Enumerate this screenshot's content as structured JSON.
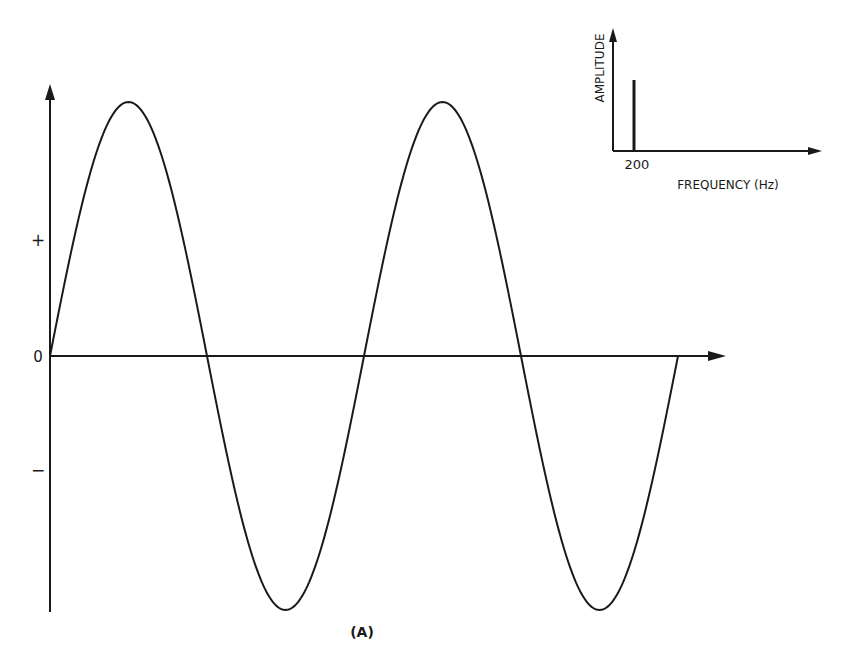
{
  "figure": {
    "caption": "(A)",
    "main_plot": {
      "y_labels": {
        "plus": "+",
        "zero": "0",
        "minus": "−"
      },
      "waveform": "sine",
      "cycles": 2,
      "line_color": "#1a1a1a"
    },
    "inset": {
      "ylabel": "AMPLITUDE",
      "xlabel": "FREQUENCY (Hz)",
      "tick_label": "200"
    }
  },
  "chart_data": [
    {
      "type": "line",
      "title": "",
      "xlabel": "",
      "ylabel": "",
      "ytick_labels": [
        "+",
        "0",
        "−"
      ],
      "description": "Pure sine wave, two full cycles, starting at 0 going positive",
      "x": [
        0,
        0.25,
        0.5,
        0.75,
        1.0,
        1.25,
        1.5,
        1.75,
        2.0
      ],
      "values": [
        0,
        1,
        0,
        -1,
        0,
        1,
        0,
        -1,
        0
      ],
      "ylim": [
        -1,
        1
      ],
      "grid": false
    },
    {
      "type": "bar",
      "title": "",
      "xlabel": "FREQUENCY (Hz)",
      "ylabel": "AMPLITUDE",
      "categories": [
        "200"
      ],
      "values": [
        1
      ],
      "description": "Single spectral line at 200 Hz",
      "grid": false
    }
  ]
}
